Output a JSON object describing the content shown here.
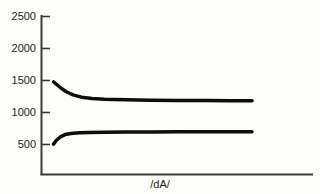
{
  "chart_data": {
    "type": "line",
    "title": "",
    "subtitle": "",
    "xlabel": "/dA/",
    "ylabel": "",
    "grid": false,
    "legend": "none",
    "ylim": [
      0,
      2500
    ],
    "xlim": [
      0,
      1
    ],
    "y_ticks": [
      2500,
      2000,
      1500,
      1000,
      500
    ],
    "y_tick_labels": [
      "2500",
      "2000",
      "1500",
      "1000",
      "500"
    ],
    "x_ticks": [],
    "x_tick_labels": [],
    "series": [
      {
        "name": "upper-curve",
        "color": "#0d0d0d",
        "line_width_units": 55,
        "x": [
          0.057,
          0.075,
          0.095,
          0.12,
          0.15,
          0.19,
          0.24,
          0.3,
          0.4,
          0.52,
          0.65,
          0.78,
          0.9,
          1.0
        ],
        "values": [
          1480,
          1430,
          1375,
          1320,
          1275,
          1240,
          1220,
          1208,
          1198,
          1192,
          1188,
          1186,
          1184,
          1182
        ]
      },
      {
        "name": "lower-curve",
        "color": "#0d0d0d",
        "line_width_units": 55,
        "x": [
          0.057,
          0.072,
          0.09,
          0.112,
          0.14,
          0.18,
          0.23,
          0.3,
          0.4,
          0.52,
          0.65,
          0.78,
          0.9,
          1.0
        ],
        "values": [
          505,
          570,
          620,
          655,
          672,
          682,
          688,
          691,
          694,
          696,
          698,
          699,
          700,
          701
        ]
      }
    ],
    "axis_color": "#3a3a3a",
    "background_color": "#fdfdfc"
  },
  "axis": {
    "x_axis_label": "/dA/",
    "y_tick_2500": "2500",
    "y_tick_2000": "2000",
    "y_tick_1500": "1500",
    "y_tick_1000": "1000",
    "y_tick_500": "500"
  }
}
